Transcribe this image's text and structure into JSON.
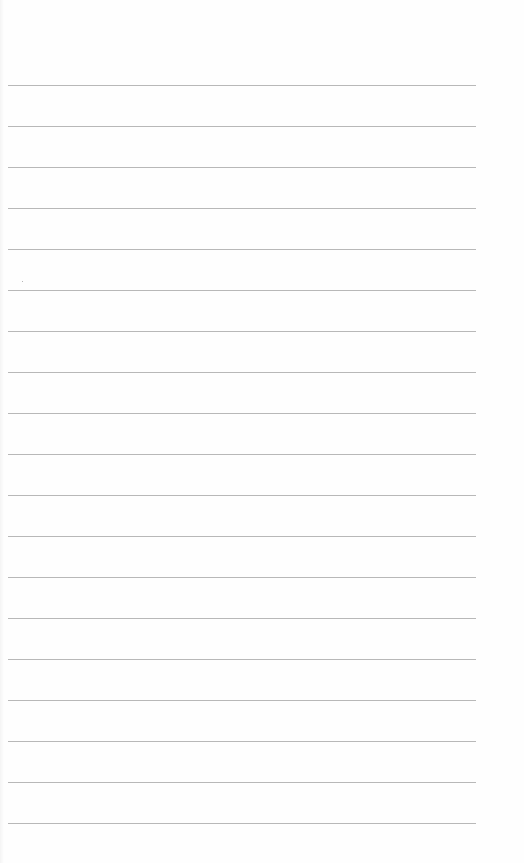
{
  "page": {
    "type": "ruled-notebook-page",
    "background_color": "#fefefe",
    "rule_color": "#ababab",
    "rules": {
      "count": 19,
      "first_y": 85,
      "spacing": 41,
      "left_x": 8,
      "right_x": 476
    },
    "content_text": []
  }
}
